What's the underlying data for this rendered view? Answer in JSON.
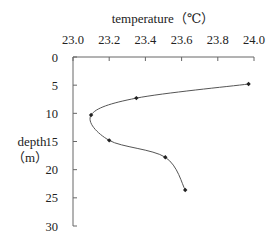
{
  "chart_data": {
    "type": "line",
    "title": "",
    "xlabel": "temperature（℃）",
    "ylabel_line1": "depth",
    "ylabel_line2": "（m）",
    "x_axis_position": "top",
    "y_axis_inverted": true,
    "xlim": [
      23.0,
      24.0
    ],
    "ylim": [
      0,
      30
    ],
    "x_ticks": [
      23.0,
      23.2,
      23.4,
      23.6,
      23.8,
      24.0
    ],
    "x_tick_labels": [
      "23.0",
      "23.2",
      "23.4",
      "23.6",
      "23.8",
      "24.0"
    ],
    "y_ticks": [
      0,
      5,
      10,
      15,
      20,
      25,
      30
    ],
    "y_tick_labels": [
      "0",
      "5",
      "10",
      "15",
      "20",
      "25",
      "30"
    ],
    "grid": false,
    "legend": null,
    "smooth": true,
    "series": [
      {
        "name": "temperature profile",
        "points": [
          {
            "temperature": 23.97,
            "depth": 4.8
          },
          {
            "temperature": 23.35,
            "depth": 7.3
          },
          {
            "temperature": 23.1,
            "depth": 10.3
          },
          {
            "temperature": 23.2,
            "depth": 14.8
          },
          {
            "temperature": 23.51,
            "depth": 17.8
          },
          {
            "temperature": 23.62,
            "depth": 23.6
          }
        ],
        "color": "#555555",
        "marker": "diamond"
      }
    ]
  },
  "colors": {
    "axis": "#666666",
    "line": "#555555",
    "marker": "#222222",
    "text": "#222222"
  }
}
